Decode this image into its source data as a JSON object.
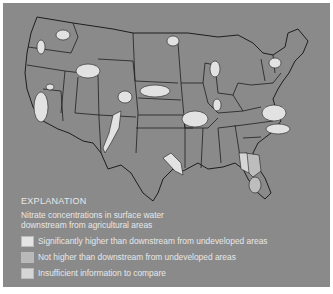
{
  "map": {
    "subject": "Conterminous United States",
    "colors": {
      "background": "#8a8a8a",
      "state_fill": "#8a8a8a",
      "border": "#1e1e1e"
    }
  },
  "legend": {
    "title": "EXPLANATION",
    "subtitle_line1": "Nitrate concentrations in surface water",
    "subtitle_line2": "downstream from agricultural areas",
    "items": [
      {
        "label": "Significantly higher than downstream from undeveloped areas",
        "color": "#e4e4e4"
      },
      {
        "label": "Not higher than downstream from undeveloped areas",
        "color": "#b9b9b9"
      },
      {
        "label": "Insufficient information to compare",
        "color": "#d6d6d6"
      }
    ]
  }
}
